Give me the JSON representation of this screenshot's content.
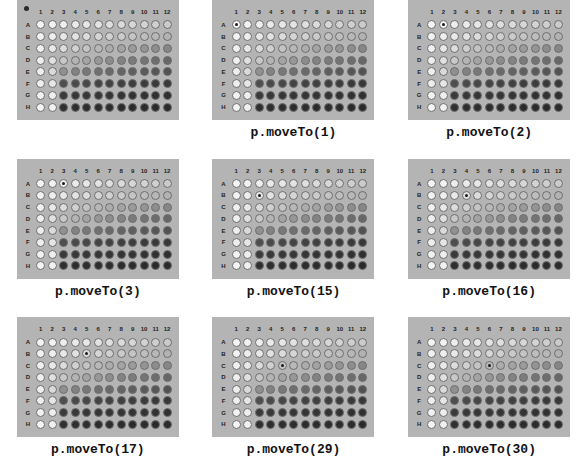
{
  "figure": {
    "plate_rows": [
      "A",
      "B",
      "C",
      "D",
      "E",
      "F",
      "G",
      "H"
    ],
    "plate_columns": [
      "1",
      "2",
      "3",
      "4",
      "5",
      "6",
      "7",
      "8",
      "9",
      "10",
      "11",
      "12"
    ],
    "plate_bg_color": "#b4b4b4",
    "page_bg_color": "#ffffff",
    "well_border_color": "#6e6e6e",
    "marker_color": "#1a1a1a",
    "gradient_light": "#f2f2f2",
    "gradient_dark": "#2b2b2b"
  },
  "panels": [
    {
      "caption": "",
      "has_caption": false,
      "home_dot": true,
      "marker_index": null,
      "marker_row": null,
      "marker_col": null,
      "marker_well": ""
    },
    {
      "caption": "p.moveTo(1)",
      "has_caption": true,
      "home_dot": false,
      "marker_index": 1,
      "marker_row": 0,
      "marker_col": 0,
      "marker_well": "A1"
    },
    {
      "caption": "p.moveTo(2)",
      "has_caption": true,
      "home_dot": false,
      "marker_index": 2,
      "marker_row": 0,
      "marker_col": 1,
      "marker_well": "A2"
    },
    {
      "caption": "p.moveTo(3)",
      "has_caption": true,
      "home_dot": false,
      "marker_index": 3,
      "marker_row": 0,
      "marker_col": 2,
      "marker_well": "A3"
    },
    {
      "caption": "p.moveTo(15)",
      "has_caption": true,
      "home_dot": false,
      "marker_index": 15,
      "marker_row": 1,
      "marker_col": 2,
      "marker_well": "B3"
    },
    {
      "caption": "p.moveTo(16)",
      "has_caption": true,
      "home_dot": false,
      "marker_index": 16,
      "marker_row": 1,
      "marker_col": 3,
      "marker_well": "B4"
    },
    {
      "caption": "p.moveTo(17)",
      "has_caption": true,
      "home_dot": false,
      "marker_index": 17,
      "marker_row": 1,
      "marker_col": 4,
      "marker_well": "B5"
    },
    {
      "caption": "p.moveTo(29)",
      "has_caption": true,
      "home_dot": false,
      "marker_index": 29,
      "marker_row": 2,
      "marker_col": 4,
      "marker_well": "C5"
    },
    {
      "caption": "p.moveTo(30)",
      "has_caption": true,
      "home_dot": false,
      "marker_index": 30,
      "marker_row": 2,
      "marker_col": 5,
      "marker_well": "C6"
    }
  ],
  "well_shades": [
    [
      "#f4f4f4",
      "#f2f2f2",
      "#eeeeee",
      "#eaeaea",
      "#e7e7e7",
      "#e3e3e3",
      "#dfdfdf",
      "#dbdbdb",
      "#d7d7d7",
      "#d3d3d3",
      "#cfcfcf",
      "#cbcbcb"
    ],
    [
      "#f2f2f2",
      "#eeeeee",
      "#e8e8e8",
      "#e2e2e2",
      "#dcdcdc",
      "#d6d6d6",
      "#d0d0d0",
      "#cacaca",
      "#c4c4c4",
      "#bebebe",
      "#b8b8b8",
      "#b2b2b2"
    ],
    [
      "#f0f0f0",
      "#e8e8e8",
      "#dcdcdc",
      "#d0d0d0",
      "#c4c4c4",
      "#b8b8b8",
      "#acacac",
      "#a3a3a3",
      "#9b9b9b",
      "#949494",
      "#8d8d8d",
      "#868686"
    ],
    [
      "#efefef",
      "#e0e0e0",
      "#c8c8c8",
      "#b4b4b4",
      "#a4a4a4",
      "#979797",
      "#8c8c8c",
      "#838383",
      "#7b7b7b",
      "#747474",
      "#6d6d6d",
      "#676767"
    ],
    [
      "#eeeeee",
      "#dadada",
      "#909090",
      "#828282",
      "#787878",
      "#707070",
      "#6a6a6a",
      "#646464",
      "#5f5f5f",
      "#5a5a5a",
      "#565656",
      "#525252"
    ],
    [
      "#eeeeee",
      "#e6e6e6",
      "#4e4e4e",
      "#4a4a4a",
      "#474747",
      "#444444",
      "#424242",
      "#404040",
      "#3e3e3e",
      "#3c3c3c",
      "#3a3a3a",
      "#383838"
    ],
    [
      "#f2f2f2",
      "#eeeeee",
      "#3a3a3a",
      "#383838",
      "#373737",
      "#363636",
      "#353535",
      "#343434",
      "#333333",
      "#323232",
      "#313131",
      "#303030"
    ],
    [
      "#f4f4f4",
      "#f0f0f0",
      "#2f2f2f",
      "#2e2e2e",
      "#2e2e2e",
      "#2d2d2d",
      "#2d2d2d",
      "#2c2c2c",
      "#2c2c2c",
      "#2c2c2c",
      "#2b2b2b",
      "#2b2b2b"
    ]
  ]
}
